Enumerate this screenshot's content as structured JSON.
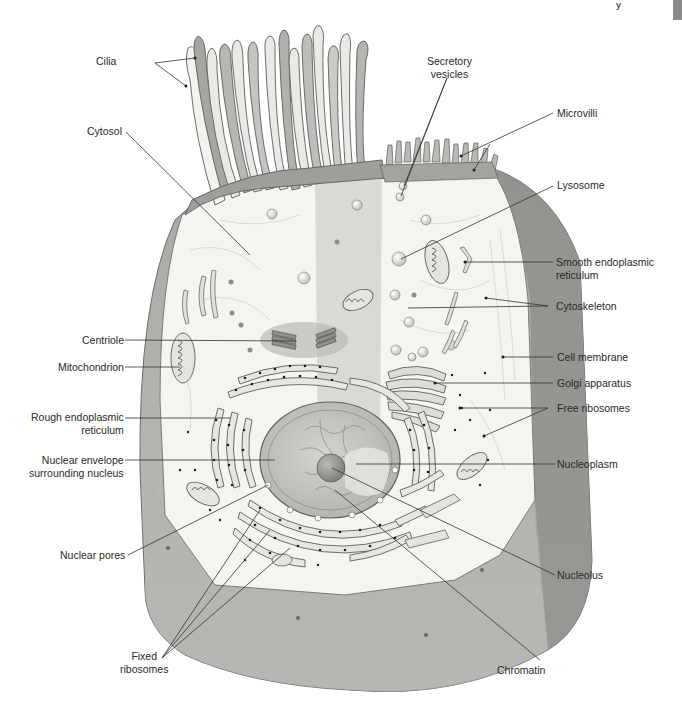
{
  "figure": {
    "header_fragment": "y",
    "colors": {
      "membrane": "#9a9a9a",
      "membrane_dark": "#7d7d7d",
      "cytosol": "#f3f3ef",
      "cytosol_center_band": "#d8d8d4",
      "organelle_fill": "#e6e6e2",
      "organelle_stroke": "#6e6e6e",
      "nucleus": "#c9c9c4",
      "ribosome_dot": "#1e1e1e",
      "leader_line": "#333333",
      "label_text": "#2a2a2a"
    }
  },
  "labels": {
    "left": [
      {
        "id": "cilia",
        "text": "Cilia"
      },
      {
        "id": "cytosol",
        "text": "Cytosol"
      },
      {
        "id": "centriole",
        "text": "Centriole"
      },
      {
        "id": "mitochondrion",
        "text": "Mitochondrion"
      },
      {
        "id": "rough_er",
        "text": "Rough endoplasmic\nreticulum"
      },
      {
        "id": "nuclear_envelope",
        "text": "Nuclear envelope\nsurrounding nucleus"
      },
      {
        "id": "nuclear_pores",
        "text": "Nuclear pores"
      },
      {
        "id": "fixed_ribosomes",
        "text": "Fixed\nribosomes"
      }
    ],
    "right": [
      {
        "id": "secretory_vesicles",
        "text": "Secretory\nvesicles"
      },
      {
        "id": "microvilli",
        "text": "Microvilli"
      },
      {
        "id": "lysosome",
        "text": "Lysosome"
      },
      {
        "id": "smooth_er",
        "text": "Smooth endoplasmic\nreticulum"
      },
      {
        "id": "cytoskeleton",
        "text": "Cytoskeleton"
      },
      {
        "id": "cell_membrane",
        "text": "Cell membrane"
      },
      {
        "id": "golgi",
        "text": "Golgi apparatus"
      },
      {
        "id": "free_ribosomes",
        "text": "Free ribosomes"
      },
      {
        "id": "nucleoplasm",
        "text": "Nucleoplasm"
      },
      {
        "id": "nucleolus",
        "text": "Nucleolus"
      },
      {
        "id": "chromatin",
        "text": "Chromatin"
      }
    ]
  }
}
